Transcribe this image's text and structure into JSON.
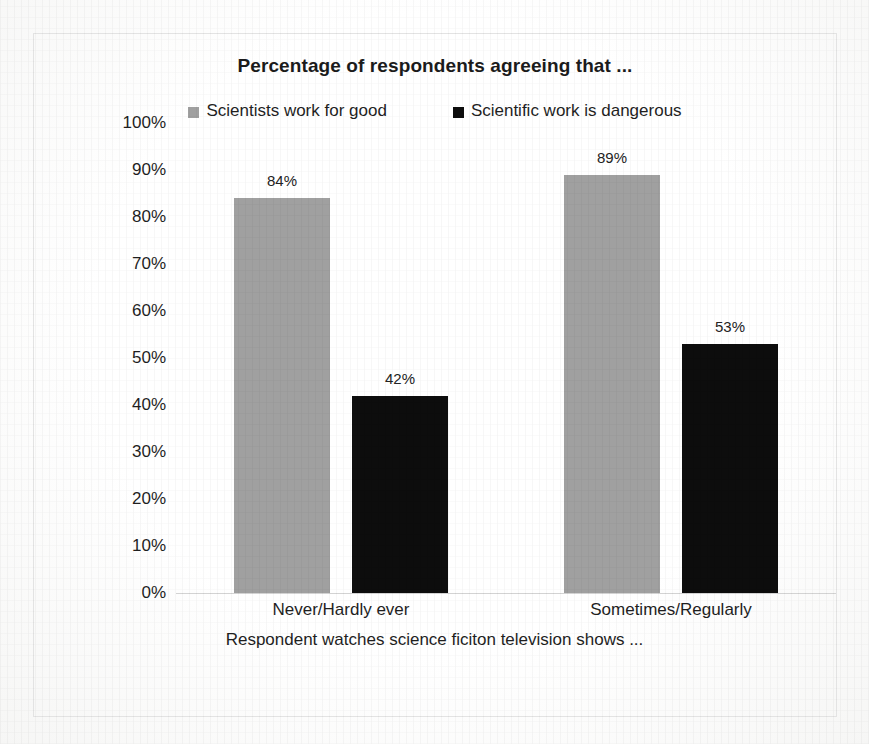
{
  "chart_data": {
    "type": "bar",
    "title": "Percentage of respondents agreeing that ...",
    "xlabel": "Respondent watches science ficiton television shows ...",
    "ylabel": "",
    "categories": [
      "Never/Hardly ever",
      "Sometimes/Regularly"
    ],
    "series": [
      {
        "name": "Scientists work for good",
        "color": "#a0a0a0",
        "values": [
          84,
          89
        ],
        "value_labels": [
          "84%",
          "53%"
        ]
      },
      {
        "name": "Scientific work is dangerous",
        "color": "#0d0d0d",
        "values": [
          42,
          53
        ],
        "value_labels": [
          "42%",
          "53%"
        ]
      }
    ],
    "bars": [
      {
        "category": "Never/Hardly ever",
        "series": "Scientists work for good",
        "value": 84,
        "label": "84%",
        "color": "#a0a0a0"
      },
      {
        "category": "Never/Hardly ever",
        "series": "Scientific work is dangerous",
        "value": 42,
        "label": "42%",
        "color": "#0d0d0d"
      },
      {
        "category": "Sometimes/Regularly",
        "series": "Scientists work for good",
        "value": 89,
        "label": "89%",
        "color": "#a0a0a0"
      },
      {
        "category": "Sometimes/Regularly",
        "series": "Scientific work is dangerous",
        "value": 53,
        "label": "53%",
        "color": "#0d0d0d"
      }
    ],
    "ylim": [
      0,
      100
    ],
    "ytick_labels": [
      "100%",
      "90%",
      "80%",
      "70%",
      "60%",
      "50%",
      "40%",
      "30%",
      "20%",
      "10%",
      "0%"
    ],
    "ytick_values": [
      100,
      90,
      80,
      70,
      60,
      50,
      40,
      30,
      20,
      10,
      0
    ],
    "grid": false,
    "legend_position": "top"
  },
  "legend": {
    "entries": [
      {
        "label": "Scientists work for good",
        "color": "#a0a0a0"
      },
      {
        "label": "Scientific work is dangerous",
        "color": "#0d0d0d"
      }
    ]
  },
  "colors": {
    "series_light": "#a0a0a0",
    "series_dark": "#0d0d0d",
    "axis": "#d3d3d3",
    "frame": "#e3e3e3",
    "text": "#1f1f1f"
  }
}
